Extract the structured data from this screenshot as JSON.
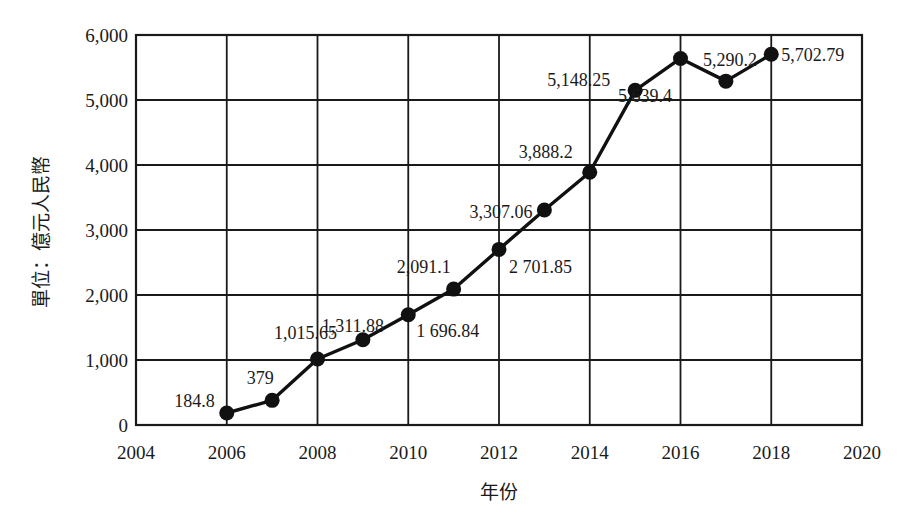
{
  "chart_data": {
    "type": "line",
    "title": "",
    "xlabel": "年份",
    "ylabel": "單位：億元人民幣",
    "xlim": [
      2004,
      2020
    ],
    "ylim": [
      0,
      6000
    ],
    "x_ticks": [
      2004,
      2006,
      2008,
      2010,
      2012,
      2014,
      2016,
      2018,
      2020
    ],
    "x_tick_labels": [
      "2004",
      "2006",
      "2008",
      "2010",
      "2012",
      "2014",
      "2016",
      "2018",
      "2020"
    ],
    "y_ticks": [
      0,
      1000,
      2000,
      3000,
      4000,
      5000,
      6000
    ],
    "y_tick_labels": [
      "0",
      "1,000",
      "2,000",
      "3,000",
      "4,000",
      "5,000",
      "6,000"
    ],
    "grid": true,
    "legend": null,
    "x": [
      2006,
      2007,
      2008,
      2009,
      2010,
      2011,
      2012,
      2013,
      2014,
      2015,
      2016,
      2017,
      2018
    ],
    "series": [
      {
        "name": "value",
        "values": [
          184.8,
          379,
          1015.65,
          1311.88,
          1696.84,
          2091.1,
          2701.85,
          3307.06,
          3888.2,
          5148.25,
          5639.4,
          5290.2,
          5702.79
        ]
      }
    ],
    "annotations": [
      {
        "text": "184.8",
        "x": 2006
      },
      {
        "text": "379",
        "x": 2007
      },
      {
        "text": "1,015.65",
        "x": 2008
      },
      {
        "text": "1,311.88",
        "x": 2009
      },
      {
        "text": "1 696.84",
        "x": 2010
      },
      {
        "text": "2,091.1",
        "x": 2011
      },
      {
        "text": "2 701.85",
        "x": 2012
      },
      {
        "text": "3,307.06",
        "x": 2013
      },
      {
        "text": "3,888.2",
        "x": 2014
      },
      {
        "text": "5,148.25",
        "x": 2015
      },
      {
        "text": "5,639.4",
        "x": 2016
      },
      {
        "text": "5,290.2",
        "x": 2017
      },
      {
        "text": "5,702.79",
        "x": 2018
      }
    ]
  },
  "labels": {
    "x_axis_title": "年份",
    "y_axis_title": "單位：億元人民幣"
  }
}
